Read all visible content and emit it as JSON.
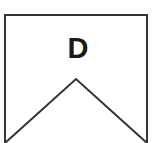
{
  "shape": {
    "label": "D",
    "stroke_color": "#333333",
    "fill_color": "#ffffff",
    "outline_points": "5,143 5,15 147,15 147,143 76,79 5,143"
  }
}
